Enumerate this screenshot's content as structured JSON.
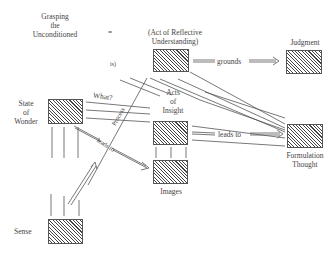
{
  "nodes": {
    "grasping": {
      "label_lines": [
        "Grasping",
        "the",
        "Unconditioned"
      ]
    },
    "equals": {
      "label": "="
    },
    "reflective": {
      "label_lines": [
        "(Act of Reflective",
        "Understanding)"
      ]
    },
    "is": {
      "label": "is)"
    },
    "judgment": {
      "label": "Judgment"
    },
    "wonder": {
      "label_lines": [
        "State",
        "of",
        "Wonder"
      ]
    },
    "insight": {
      "label_lines": [
        "Acts",
        "of",
        "Insight"
      ]
    },
    "formulation": {
      "label_lines": [
        "Formulation",
        "Thought"
      ]
    },
    "images": {
      "label": "Images"
    },
    "sense": {
      "label": "Sense"
    }
  },
  "edges": {
    "grounds": {
      "label": "grounds"
    },
    "leads_to_formulation": {
      "label": "leads to"
    },
    "leads_to_images": {
      "label": "leads to"
    },
    "what": {
      "label": "What?"
    },
    "process": {
      "label": "Process"
    }
  },
  "colors": {
    "line": "#555555",
    "hatch": "#444444",
    "text": "#444444"
  }
}
